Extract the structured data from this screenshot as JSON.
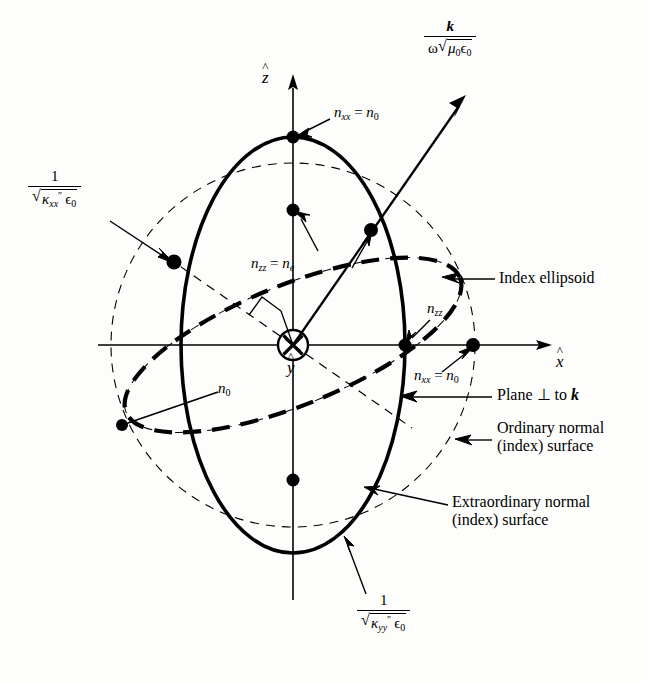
{
  "figure": {
    "background_color": "#fdfdfb",
    "ink_color": "#000000"
  },
  "axes": {
    "z_label": "z",
    "z_hat": "^",
    "x_label": "x",
    "x_hat": "^",
    "y_label": "y",
    "y_hat": "^",
    "y_icon": "circle-x-into-page"
  },
  "vectors": {
    "k": {
      "numerator": "k",
      "den_omega": "ω",
      "den_radicand_mu": "μ",
      "den_radicand_mu_sub": "0",
      "den_radicand_eps": "ϵ",
      "den_radicand_eps_sub": "0"
    }
  },
  "formulas": {
    "kappa_xx": {
      "numerator": "1",
      "kappa": "κ",
      "primes": "″",
      "sub": "xx",
      "eps": "ϵ",
      "eps_sub": "0"
    },
    "kappa_yy": {
      "numerator": "1",
      "kappa": "κ",
      "primes": "″",
      "sub": "yy",
      "eps": "ϵ",
      "eps_sub": "0"
    }
  },
  "annotations": {
    "n_xx_top": {
      "n": "n",
      "sub": "xx",
      "eq": "=",
      "n2": "n",
      "sub2": "0"
    },
    "n_xx_right": {
      "n": "n",
      "sub": "xx",
      "eq": "=",
      "n2": "n",
      "sub2": "0"
    },
    "n_zz_ne": {
      "n": "n",
      "sub": "zz",
      "eq": "=",
      "n2": "n",
      "sub2": "e"
    },
    "n_zz": {
      "n": "n",
      "sub": "zz"
    },
    "n_0": {
      "n": "n",
      "sub": "0"
    },
    "index_ellipsoid": "Index ellipsoid",
    "plane_perp_k_pre": "Plane ⊥ to ",
    "plane_perp_k_vec": "k",
    "ordinary_line1": "Ordinary normal",
    "ordinary_line2": "(index) surface",
    "extraordinary_line1": "Extraordinary normal",
    "extraordinary_line2": "(index) surface"
  },
  "geometry": {
    "origin": {
      "x": 293,
      "y": 345
    },
    "outer_circle_radius": 182,
    "solid_ellipse_rx": 112,
    "solid_ellipse_ry": 208,
    "tilted_dashed_ellipse_rx": 180,
    "tilted_dashed_ellipse_ry": 60,
    "tilted_dashed_ellipse_rotation_deg": -22,
    "inner_thin_ellipse_rx": 120,
    "inner_thin_ellipse_ry": 42,
    "k_arrow_tip": {
      "x": 464,
      "y": 98
    },
    "k_intersection_point": {
      "x": 371,
      "y": 230
    },
    "marked_points": [
      {
        "name": "top-vertex",
        "x": 293,
        "y": 137
      },
      {
        "name": "nzz-ne-point",
        "x": 293,
        "y": 210
      },
      {
        "name": "k-intersection",
        "x": 371,
        "y": 230
      },
      {
        "name": "left-tilted-point",
        "x": 174,
        "y": 262
      },
      {
        "name": "nzz-axis-point",
        "x": 405,
        "y": 345
      },
      {
        "name": "nxx-axis-point",
        "x": 473,
        "y": 345
      },
      {
        "name": "n0-lower-left-point",
        "x": 122,
        "y": 425
      },
      {
        "name": "bottom-tilted-point",
        "x": 293,
        "y": 480
      }
    ]
  }
}
